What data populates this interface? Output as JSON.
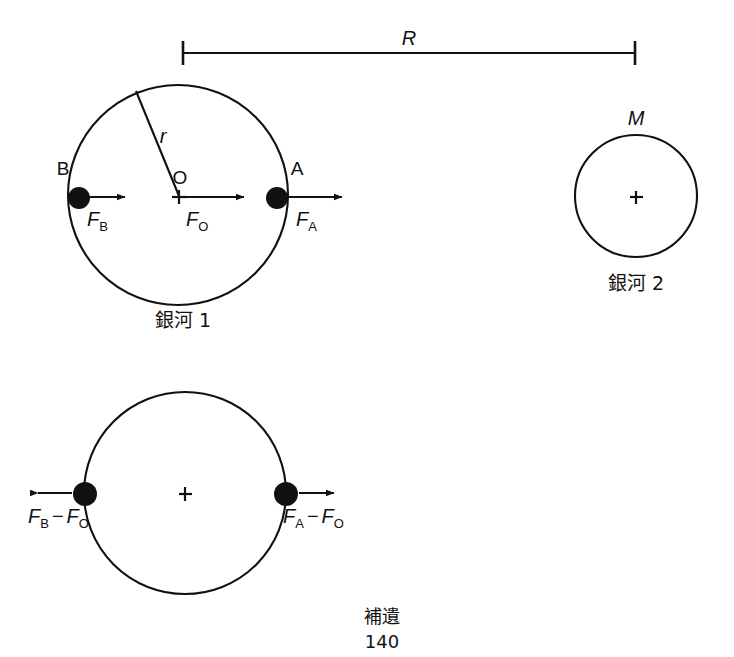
{
  "figure": {
    "page_footer_label": "補遺",
    "page_number": "140",
    "stroke_color": "#111111",
    "background_color": "#ffffff"
  },
  "dimension": {
    "label": "R",
    "description": "separation between galaxy centers"
  },
  "galaxy1": {
    "caption": "銀河 1",
    "center_label": "O",
    "radius_label": "r",
    "point_a_label": "A",
    "point_b_label": "B",
    "force_a": {
      "base": "F",
      "sub": "A"
    },
    "force_b": {
      "base": "F",
      "sub": "B"
    },
    "force_o": {
      "base": "F",
      "sub": "O"
    }
  },
  "galaxy2": {
    "caption": "銀河 2",
    "mass_label": "M"
  },
  "galaxy1_relative": {
    "force_a_rel": {
      "base1": "F",
      "sub1": "A",
      "op": "−",
      "base2": "F",
      "sub2": "O"
    },
    "force_b_rel": {
      "base1": "F",
      "sub1": "B",
      "op": "−",
      "base2": "F",
      "sub2": "O"
    }
  }
}
